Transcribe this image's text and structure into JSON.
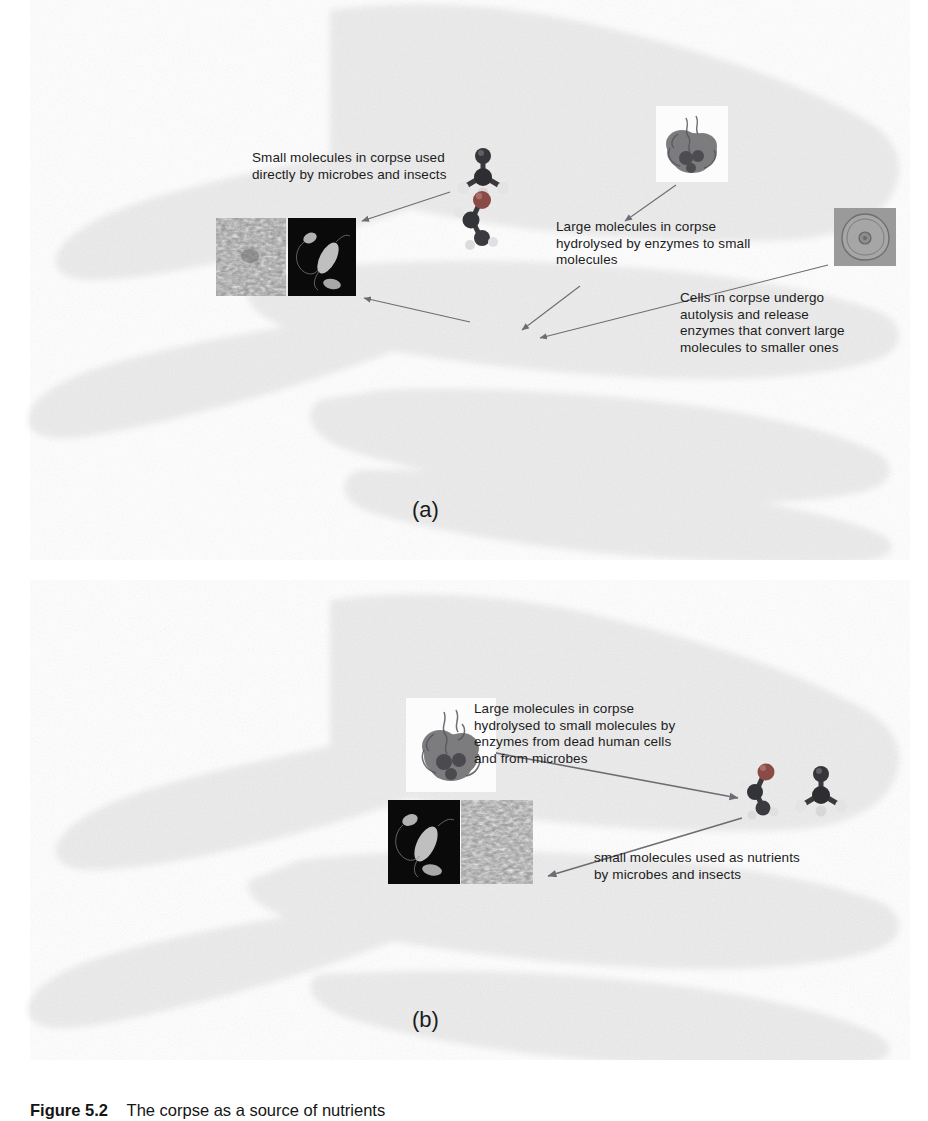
{
  "figure": {
    "caption_label": "Figure 5.2",
    "caption_text": "The corpse as a source of nutrients",
    "panel_a_letter": "(a)",
    "panel_b_letter": "(b)"
  },
  "panel_a": {
    "labels": [
      {
        "id": "small-molecules-direct",
        "text": "Small molecules in corpse used\ndirectly by microbes and insects"
      },
      {
        "id": "large-molecules-hydrolysed",
        "text": "Large molecules in corpse\nhydrolysed by enzymes to small\nmolecules"
      },
      {
        "id": "cells-autolysis",
        "text": "Cells in corpse undergo\nautolysis and release\nenzymes that convert large\nmolecules to smaller ones"
      }
    ],
    "images": [
      {
        "id": "insect-sem-micrograph",
        "kind": "sem-texture"
      },
      {
        "id": "bacteria-micrograph",
        "kind": "dark-bacteria"
      },
      {
        "id": "small-molecule-model-top",
        "kind": "ball-and-stick"
      },
      {
        "id": "small-molecule-model-bottom",
        "kind": "ball-and-stick"
      },
      {
        "id": "protein-macromolecule-model",
        "kind": "protein-blob"
      },
      {
        "id": "human-cell-micrograph",
        "kind": "cell"
      }
    ]
  },
  "panel_b": {
    "labels": [
      {
        "id": "large-molecules-hydrolysed-b",
        "text": "Large molecules in corpse\nhydrolysed to small molecules by\nenzymes from dead human cells\nand from microbes"
      },
      {
        "id": "small-molecules-nutrients",
        "text": "small molecules used as nutrients\nby microbes and insects"
      }
    ],
    "images": [
      {
        "id": "protein-macromolecule-model-b",
        "kind": "protein-blob"
      },
      {
        "id": "bacteria-micrograph-b",
        "kind": "dark-bacteria"
      },
      {
        "id": "insect-sem-micrograph-b",
        "kind": "sem-texture"
      },
      {
        "id": "small-molecule-model-left-b",
        "kind": "ball-and-stick"
      },
      {
        "id": "small-molecule-model-right-b",
        "kind": "ball-and-stick"
      }
    ]
  },
  "colors": {
    "silhouette": "#ededed",
    "arrow": "#6c6c74",
    "text": "#1c1c1c",
    "carbon_atom": "#3a3a3c",
    "oxygen_atom": "#8a4b46",
    "hydrogen_atom": "#e8e8e8",
    "background": "#ffffff"
  }
}
